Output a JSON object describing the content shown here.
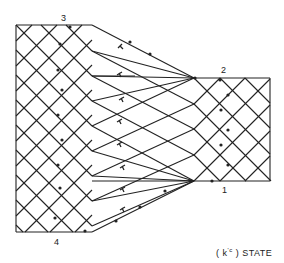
{
  "diagram": {
    "type": "characteristic-mesh",
    "caption": "(k'c) STATE",
    "caption_parts": {
      "open": "( k",
      "sup": "'c",
      "close": " ) STATE"
    },
    "corner_labels": [
      {
        "id": "3",
        "text": "3"
      },
      {
        "id": "2",
        "text": "2"
      },
      {
        "id": "1",
        "text": "1"
      },
      {
        "id": "4",
        "text": "4"
      }
    ],
    "regions": [
      {
        "name": "left-uniform-region",
        "bounds": [
          16,
          25,
          92,
          232
        ]
      },
      {
        "name": "fan-region",
        "bounds": [
          92,
          25,
          194,
          232
        ]
      },
      {
        "name": "right-uniform-region",
        "bounds": [
          194,
          78,
          270,
          181
        ]
      }
    ],
    "markers": {
      "T_symbols": 7,
      "arrows": "characteristic-direction"
    },
    "line_color": "#222222",
    "background": "#ffffff"
  }
}
